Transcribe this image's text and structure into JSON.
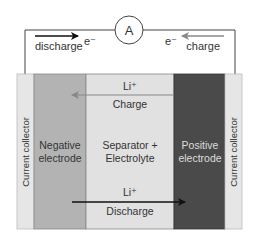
{
  "circuit": {
    "ammeter_label": "A",
    "left_label": "discharge",
    "left_electron": "e⁻",
    "right_label": "charge",
    "right_electron": "e⁻"
  },
  "layers": [
    {
      "name": "left-current-collector",
      "label": "Current collector",
      "color": "#e6e6e6"
    },
    {
      "name": "negative-electrode",
      "label_line1": "Negative",
      "label_line2": "electrode",
      "color": "#b3b3b3"
    },
    {
      "name": "separator-electrolyte",
      "label_line1": "Separator +",
      "label_line2": "Electrolyte",
      "color": "#e1e1e1"
    },
    {
      "name": "positive-electrode",
      "label_line1": "Positive",
      "label_line2": "electrode",
      "color": "#4a4a4a"
    },
    {
      "name": "right-current-collector",
      "label": "Current collector",
      "color": "#e6e6e6"
    }
  ],
  "ion_flows": {
    "charge": {
      "ion": "Li⁺",
      "label": "Charge",
      "direction": "right-to-left",
      "color": "#888888"
    },
    "discharge": {
      "ion": "Li⁺",
      "label": "Discharge",
      "direction": "left-to-right",
      "color": "#111111"
    }
  },
  "colors": {
    "wire": "#444444",
    "discharge_arrow": "#111111",
    "charge_arrow": "#888888",
    "positive_text": "#dddddd"
  }
}
